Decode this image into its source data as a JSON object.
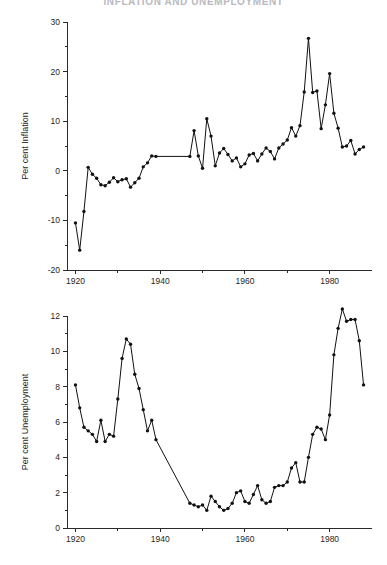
{
  "page": {
    "title": "INFLATION AND UNEMPLOYMENT"
  },
  "chart_data": [
    {
      "id": "inflation",
      "type": "line",
      "title": "",
      "xlabel": "",
      "ylabel": "Per cent Inflation",
      "xlim": [
        1918,
        1990
      ],
      "ylim": [
        -20,
        30
      ],
      "xticks": [
        1920,
        1940,
        1960,
        1980
      ],
      "xticklabels": [
        "1920",
        "1940",
        "1960",
        "1980"
      ],
      "xminorticks": [
        1930,
        1950,
        1970
      ],
      "yticks": [
        -20,
        -10,
        0,
        10,
        20,
        30
      ],
      "yticklabels": [
        "-20",
        "-10",
        "0",
        "10",
        "20",
        "30"
      ],
      "yminorticks": [
        -15,
        -5,
        5,
        15,
        25
      ],
      "grid": false,
      "legend": "none",
      "marker": "filled-circle",
      "x": [
        1920,
        1921,
        1922,
        1923,
        1924,
        1925,
        1926,
        1927,
        1928,
        1929,
        1930,
        1931,
        1932,
        1933,
        1934,
        1935,
        1936,
        1937,
        1938,
        1939,
        1947,
        1948,
        1949,
        1950,
        1951,
        1952,
        1953,
        1954,
        1955,
        1956,
        1957,
        1958,
        1959,
        1960,
        1961,
        1962,
        1963,
        1964,
        1965,
        1966,
        1967,
        1968,
        1969,
        1970,
        1971,
        1972,
        1973,
        1974,
        1975,
        1976,
        1977,
        1978,
        1979,
        1980,
        1981,
        1982,
        1983,
        1984,
        1985,
        1986,
        1987,
        1988
      ],
      "y": [
        -10.5,
        -16.0,
        -8.2,
        0.7,
        -0.7,
        -1.5,
        -2.8,
        -3.0,
        -2.3,
        -1.4,
        -2.2,
        -1.8,
        -1.6,
        -3.3,
        -2.4,
        -1.5,
        0.8,
        1.6,
        3.0,
        2.9,
        2.9,
        8.1,
        3.0,
        0.5,
        10.5,
        7.0,
        1.0,
        3.6,
        4.5,
        3.3,
        2.0,
        2.6,
        0.8,
        1.4,
        3.2,
        3.5,
        2.0,
        3.4,
        4.6,
        3.9,
        2.4,
        4.6,
        5.4,
        6.2,
        8.7,
        7.0,
        9.1,
        15.9,
        26.7,
        15.8,
        16.1,
        8.5,
        13.3,
        19.6,
        11.6,
        8.6,
        4.8,
        5.0,
        6.1,
        3.4,
        4.3,
        4.8
      ]
    },
    {
      "id": "unemployment",
      "type": "line",
      "title": "",
      "xlabel": "",
      "ylabel": "Per cent Unemployment",
      "xlim": [
        1918,
        1990
      ],
      "ylim": [
        0,
        12
      ],
      "xticks": [
        1920,
        1940,
        1960,
        1980
      ],
      "xticklabels": [
        "1920",
        "1940",
        "1960",
        "1980"
      ],
      "xminorticks": [
        1930,
        1950,
        1970
      ],
      "yticks": [
        0,
        2,
        4,
        6,
        8,
        10,
        12
      ],
      "yticklabels": [
        "0",
        "2",
        "4",
        "6",
        "8",
        "10",
        "12"
      ],
      "yminorticks": [
        1,
        3,
        5,
        7,
        9,
        11
      ],
      "grid": false,
      "legend": "none",
      "marker": "filled-circle",
      "x": [
        1920,
        1921,
        1922,
        1923,
        1924,
        1925,
        1926,
        1927,
        1928,
        1929,
        1930,
        1931,
        1932,
        1933,
        1934,
        1935,
        1936,
        1937,
        1938,
        1939,
        1947,
        1948,
        1949,
        1950,
        1951,
        1952,
        1953,
        1954,
        1955,
        1956,
        1957,
        1958,
        1959,
        1960,
        1961,
        1962,
        1963,
        1964,
        1965,
        1966,
        1967,
        1968,
        1969,
        1970,
        1971,
        1972,
        1973,
        1974,
        1975,
        1976,
        1977,
        1978,
        1979,
        1980,
        1981,
        1982,
        1983,
        1984,
        1985,
        1986,
        1987,
        1988
      ],
      "y": [
        8.1,
        6.8,
        5.7,
        5.5,
        5.3,
        4.9,
        6.1,
        4.9,
        5.3,
        5.2,
        7.3,
        9.6,
        10.7,
        10.4,
        8.7,
        7.9,
        6.7,
        5.5,
        6.1,
        5.0,
        1.4,
        1.3,
        1.2,
        1.3,
        1.0,
        1.8,
        1.5,
        1.2,
        1.0,
        1.1,
        1.4,
        2.0,
        2.1,
        1.5,
        1.4,
        1.9,
        2.4,
        1.6,
        1.4,
        1.5,
        2.3,
        2.4,
        2.4,
        2.6,
        3.4,
        3.7,
        2.6,
        2.6,
        4.0,
        5.3,
        5.7,
        5.6,
        5.0,
        6.4,
        9.8,
        11.3,
        12.4,
        11.7,
        11.8,
        11.8,
        10.6,
        8.1
      ]
    }
  ]
}
